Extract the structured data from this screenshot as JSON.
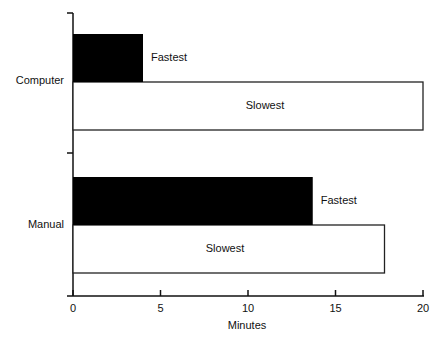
{
  "chart_data": {
    "type": "bar",
    "orientation": "horizontal",
    "title": "",
    "xlabel": "Minutes",
    "ylabel": "",
    "xlim": [
      0,
      20
    ],
    "xticks": [
      0,
      5,
      10,
      15,
      20
    ],
    "grid": false,
    "legend": "none (series labeled inline next to bars)",
    "categories": [
      "Computer",
      "Manual"
    ],
    "series": [
      {
        "name": "Fastest",
        "color": "#000000",
        "values": [
          4.0,
          13.7
        ]
      },
      {
        "name": "Slowest",
        "color": "#ffffff",
        "values": [
          20.0,
          17.8
        ]
      }
    ]
  },
  "labels": {
    "xlabel": "Minutes",
    "categories": [
      "Computer",
      "Manual"
    ],
    "fastest": "Fastest",
    "slowest": "Slowest",
    "ticks": [
      "0",
      "5",
      "10",
      "15",
      "20"
    ]
  }
}
